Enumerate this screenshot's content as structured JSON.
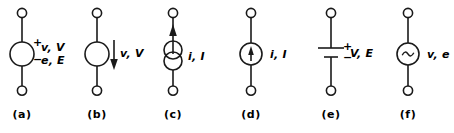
{
  "figure": {
    "background_color": "#ffffff",
    "line_color": "#1a1a1a",
    "text_color": "#000000"
  },
  "symbols": [
    {
      "caption": "(a)",
      "kind": "voltage-source-circle",
      "plus_sign": "+",
      "minus_sign": "−",
      "label_top": "v, V",
      "label_bottom": "e, E"
    },
    {
      "caption": "(b)",
      "kind": "voltage-source-circle-arrow",
      "label": "v, V",
      "arrow_direction": "down"
    },
    {
      "caption": "(c)",
      "kind": "current-source-double-circle",
      "label": "i, I",
      "arrow_direction": "up"
    },
    {
      "caption": "(d)",
      "kind": "current-source-circle-arrow",
      "label": "i, I",
      "arrow_direction": "up"
    },
    {
      "caption": "(e)",
      "kind": "battery",
      "plus_sign": "+",
      "minus_sign": "−",
      "label": "V, E"
    },
    {
      "caption": "(f)",
      "kind": "ac-source-circle",
      "glyph": "~",
      "label": "v, e"
    }
  ]
}
